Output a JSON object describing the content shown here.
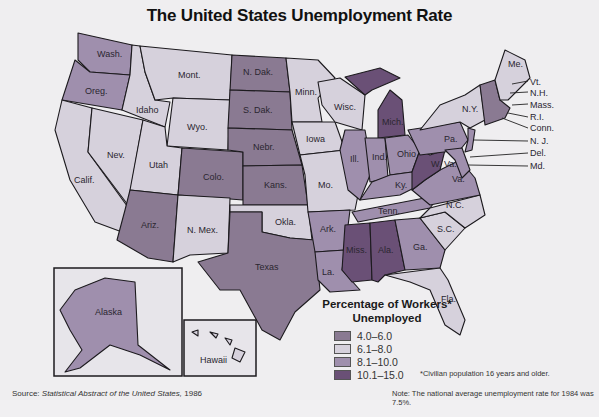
{
  "title": "The United States Unemployment Rate",
  "legend": {
    "title_line1": "Percentage of Workers*",
    "title_line2": "Unemployed",
    "items": [
      {
        "range": "4.0–6.0",
        "color": "#8a7a92"
      },
      {
        "range": "6.1–8.0",
        "color": "#d6d1dc"
      },
      {
        "range": "8.1–10.0",
        "color": "#9f8fad"
      },
      {
        "range": "10.1–15.0",
        "color": "#6a5076"
      }
    ]
  },
  "source": {
    "prefix": "Source:",
    "title": "Statistical Abstract of the United States,",
    "year": "1986"
  },
  "footnote": "*Civilian population 16 years and older.",
  "note": "Note: The national average unemployment rate for 1984 was 7.5%.",
  "states": [
    {
      "label": "Wash.",
      "range": "8.1–10.0"
    },
    {
      "label": "Oreg.",
      "range": "8.1–10.0"
    },
    {
      "label": "Calif.",
      "range": "6.1–8.0"
    },
    {
      "label": "Nev.",
      "range": "6.1–8.0"
    },
    {
      "label": "Idaho",
      "range": "6.1–8.0"
    },
    {
      "label": "Mont.",
      "range": "6.1–8.0"
    },
    {
      "label": "Wyo.",
      "range": "6.1–8.0"
    },
    {
      "label": "Utah",
      "range": "6.1–8.0"
    },
    {
      "label": "Colo.",
      "range": "4.0–6.0"
    },
    {
      "label": "Ariz.",
      "range": "4.0–6.0"
    },
    {
      "label": "N. Mex.",
      "range": "6.1–8.0"
    },
    {
      "label": "N. Dak.",
      "range": "4.0–6.0"
    },
    {
      "label": "S. Dak.",
      "range": "4.0–6.0"
    },
    {
      "label": "Nebr.",
      "range": "4.0–6.0"
    },
    {
      "label": "Kans.",
      "range": "4.0–6.0"
    },
    {
      "label": "Okla.",
      "range": "6.1–8.0"
    },
    {
      "label": "Texas",
      "range": "4.0–6.0"
    },
    {
      "label": "Minn.",
      "range": "6.1–8.0"
    },
    {
      "label": "Iowa",
      "range": "6.1–8.0"
    },
    {
      "label": "Mo.",
      "range": "6.1–8.0"
    },
    {
      "label": "Ark.",
      "range": "8.1–10.0"
    },
    {
      "label": "La.",
      "range": "8.1–10.0"
    },
    {
      "label": "Wisc.",
      "range": "6.1–8.0"
    },
    {
      "label": "Ill.",
      "range": "8.1–10.0"
    },
    {
      "label": "Mich.",
      "range": "10.1–15.0"
    },
    {
      "label": "Ind.",
      "range": "8.1–10.0"
    },
    {
      "label": "Ohio",
      "range": "8.1–10.0"
    },
    {
      "label": "Ky.",
      "range": "8.1–10.0"
    },
    {
      "label": "Tenn.",
      "range": "8.1–10.0"
    },
    {
      "label": "Miss.",
      "range": "10.1–15.0"
    },
    {
      "label": "Ala.",
      "range": "10.1–15.0"
    },
    {
      "label": "Ga.",
      "range": "8.1–10.0"
    },
    {
      "label": "Fla.",
      "range": "6.1–8.0"
    },
    {
      "label": "S.C.",
      "range": "6.1–8.0"
    },
    {
      "label": "N.C.",
      "range": "6.1–8.0"
    },
    {
      "label": "Va.",
      "range": "8.1–10.0"
    },
    {
      "label": "W. Va.",
      "range": "10.1–15.0"
    },
    {
      "label": "Pa.",
      "range": "8.1–10.0"
    },
    {
      "label": "N.Y.",
      "range": "6.1–8.0"
    },
    {
      "label": "Me.",
      "range": "6.1–8.0"
    },
    {
      "label": "Vt.",
      "range": "4.0–6.0"
    },
    {
      "label": "N.H.",
      "range": "4.0–6.0"
    },
    {
      "label": "Mass.",
      "range": "4.0–6.0"
    },
    {
      "label": "R.I.",
      "range": "4.0–6.0"
    },
    {
      "label": "Conn.",
      "range": "4.0–6.0"
    },
    {
      "label": "N. J.",
      "range": "8.1–10.0"
    },
    {
      "label": "Del.",
      "range": "8.1–10.0"
    },
    {
      "label": "Md.",
      "range": "8.1–10.0"
    },
    {
      "label": "Alaska",
      "range": "8.1–10.0"
    },
    {
      "label": "Hawaii",
      "range": "6.1–8.0"
    }
  ]
}
